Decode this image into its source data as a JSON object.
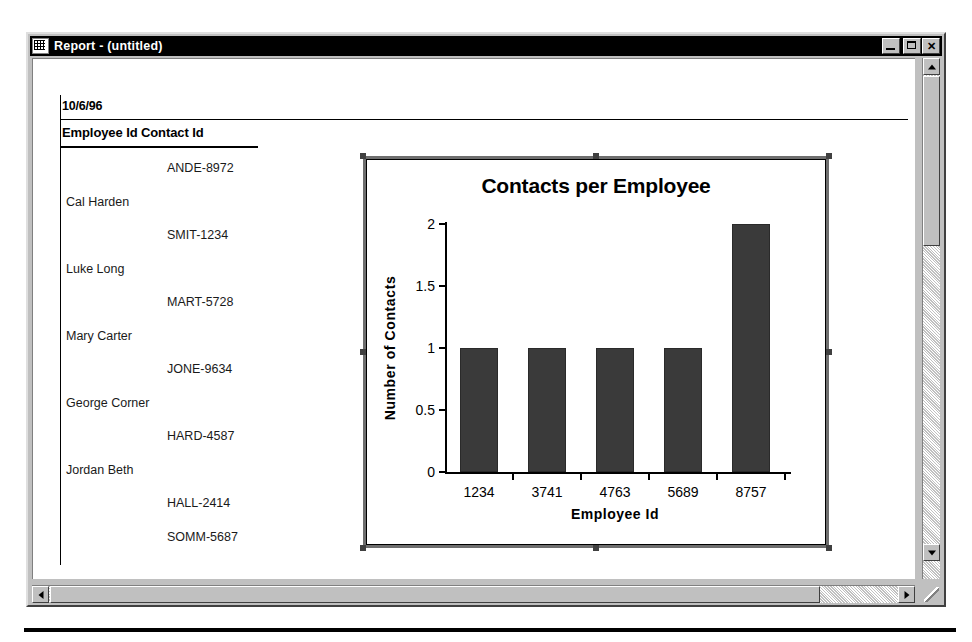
{
  "window": {
    "title": "Report - (untitled)",
    "icon": "report-grid-icon",
    "controls": {
      "minimize": "minimize-icon",
      "maximize": "maximize-icon",
      "close": "close-icon"
    }
  },
  "report": {
    "date": "10/6/96",
    "column_header": "Employee Id Contact Id",
    "rows": [
      {
        "name": "",
        "contact_id": "ANDE-8972"
      },
      {
        "name": "Cal Harden",
        "contact_id": ""
      },
      {
        "name": "",
        "contact_id": "SMIT-1234"
      },
      {
        "name": "Luke Long",
        "contact_id": ""
      },
      {
        "name": "",
        "contact_id": "MART-5728"
      },
      {
        "name": "Mary Carter",
        "contact_id": ""
      },
      {
        "name": "",
        "contact_id": "JONE-9634"
      },
      {
        "name": "George Corner",
        "contact_id": ""
      },
      {
        "name": "",
        "contact_id": "HARD-4587"
      },
      {
        "name": "Jordan Beth",
        "contact_id": ""
      },
      {
        "name": "",
        "contact_id": "HALL-2414"
      },
      {
        "name": "",
        "contact_id": "SOMM-5687"
      }
    ]
  },
  "chart_data": {
    "type": "bar",
    "title": "Contacts per Employee",
    "xlabel": "Employee Id",
    "ylabel": "Number of Contacts",
    "categories": [
      "1234",
      "3741",
      "4763",
      "5689",
      "8757"
    ],
    "values": [
      1,
      1,
      1,
      1,
      2
    ],
    "ylim": [
      0,
      2
    ],
    "yticks": [
      "0",
      "0.5",
      "1",
      "1.5",
      "2"
    ],
    "ytick_values": [
      0,
      0.5,
      1,
      1.5,
      2
    ],
    "grid": false,
    "legend": "none",
    "bar_color": "#3a3a3a"
  },
  "scrollbars": {
    "vertical": {
      "up": "scroll-up-arrow",
      "down": "scroll-down-arrow"
    },
    "horizontal": {
      "left": "scroll-left-arrow",
      "right": "scroll-right-arrow"
    }
  }
}
